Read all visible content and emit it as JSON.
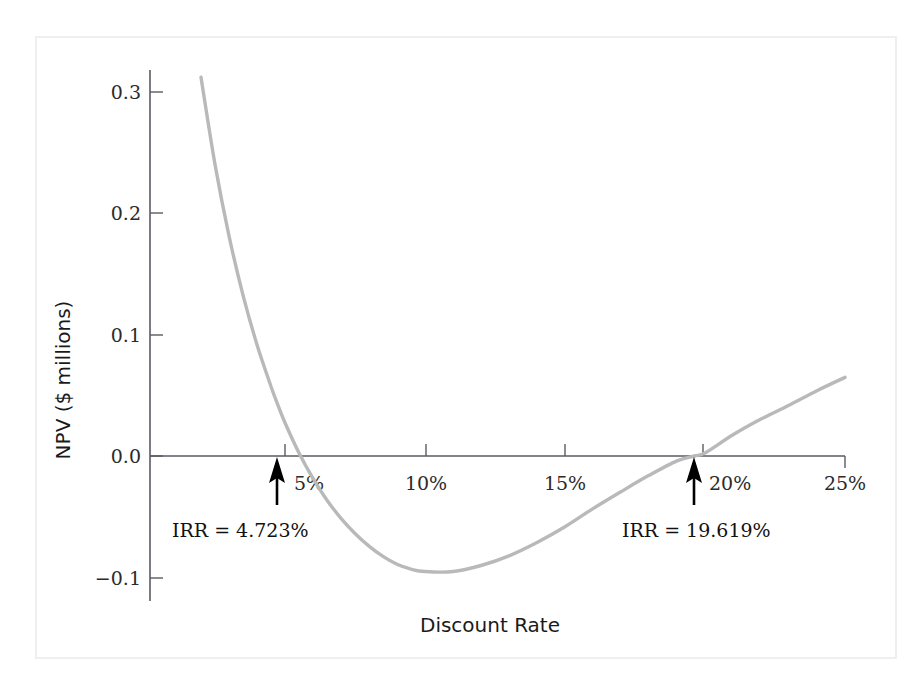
{
  "figure": {
    "background_color": "#ffffff",
    "frame_color": "#efefef",
    "curve_color": "#b9b9b9",
    "axis_color": "#5a5a63",
    "annotation_color": "#000000"
  },
  "chart_data": {
    "type": "line",
    "title": "",
    "subtitle": "",
    "xlabel": "Discount Rate",
    "ylabel": "NPV ($ millions)",
    "xlim": [
      2.0,
      25.0
    ],
    "ylim": [
      -0.12,
      0.32
    ],
    "xtick_labels": [
      "5%",
      "10%",
      "15%",
      "20%",
      "25%"
    ],
    "xtick_values": [
      5,
      10,
      15,
      20,
      25
    ],
    "ytick_labels": [
      "0.3",
      "0.2",
      "0.1",
      "0.0",
      "−0.1"
    ],
    "ytick_values": [
      0.3,
      0.2,
      0.1,
      0.0,
      -0.1
    ],
    "grid": false,
    "legend": "none",
    "series": [
      {
        "name": "NPV profile",
        "color": "#b9b9b9",
        "x": [
          2.0,
          2.5,
          3.0,
          3.5,
          4.0,
          4.5,
          4.723,
          5.0,
          5.5,
          6.0,
          6.5,
          7.0,
          7.5,
          8.0,
          8.5,
          9.0,
          9.5,
          10.0,
          11.0,
          12.0,
          13.0,
          14.0,
          15.0,
          16.0,
          17.0,
          18.0,
          19.0,
          19.619,
          20.0,
          21.0,
          22.0,
          23.0,
          24.0,
          25.0
        ],
        "y": [
          0.313,
          0.241,
          0.182,
          0.133,
          0.092,
          0.0575,
          0.0435,
          0.0275,
          0.0025,
          -0.0185,
          -0.0365,
          -0.0515,
          -0.064,
          -0.0745,
          -0.083,
          -0.0895,
          -0.0935,
          -0.0955,
          -0.0955,
          -0.0905,
          -0.0825,
          -0.0715,
          -0.0585,
          -0.0435,
          -0.0295,
          -0.016,
          -0.004,
          0.0,
          0.0025,
          0.0175,
          0.0305,
          0.042,
          0.054,
          0.065
        ]
      }
    ],
    "annotations": [
      {
        "id": "irr-low",
        "label": "IRR = 4.723%",
        "x": 4.723,
        "y": 0.0,
        "arrow": "up"
      },
      {
        "id": "irr-high",
        "label": "IRR = 19.619%",
        "x": 19.619,
        "y": 0.0,
        "arrow": "up"
      }
    ]
  }
}
